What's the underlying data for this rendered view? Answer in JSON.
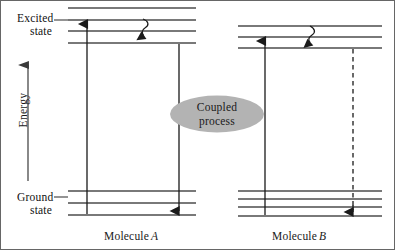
{
  "figure": {
    "axis": {
      "label": "Energy"
    },
    "level_labels": {
      "excited_line1": "Excited",
      "excited_line2": "state",
      "ground_line1": "Ground",
      "ground_line2": "state"
    },
    "annotation": {
      "coupled_line1": "Coupled",
      "coupled_line2": "process",
      "ellipse_fill": "#b3b3b3"
    },
    "molecules": [
      {
        "name": "Molecule",
        "symbol": "A",
        "excited_levels": 4,
        "ground_levels": 3,
        "absorption_arrow": "solid-up",
        "relaxation_arrow": "wavy-down",
        "emission_arrow": "solid-down"
      },
      {
        "name": "Molecule",
        "symbol": "B",
        "excited_levels": 3,
        "ground_levels": 4,
        "absorption_arrow": "solid-up",
        "relaxation_arrow": "wavy-down",
        "emission_arrow": "dashed-down"
      }
    ],
    "colors": {
      "line": "#4d4d4d",
      "arrow": "#1a1a1a",
      "border": "#555555",
      "background": "#ffffff"
    }
  }
}
